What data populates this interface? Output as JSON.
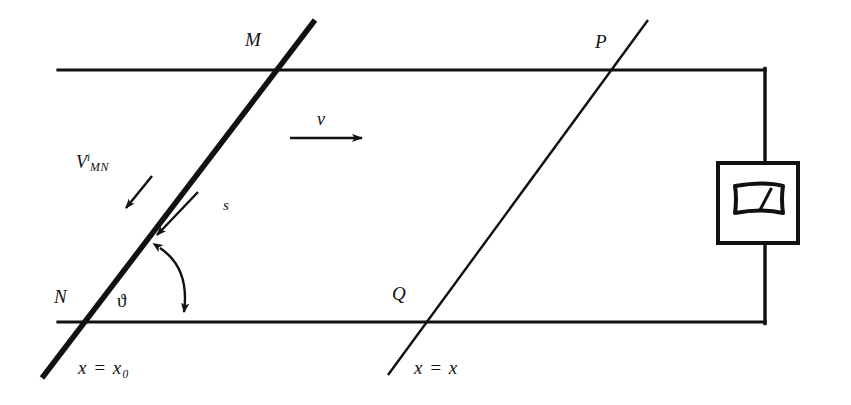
{
  "figure": {
    "background_color": "#ffffff",
    "ink_color": "#111111",
    "width": 851,
    "height": 405
  },
  "labels": {
    "point_m": "M",
    "point_n": "N",
    "point_p": "P",
    "point_q": "Q",
    "velocity": "v",
    "displacement": "s",
    "angle": "ϑ",
    "emf_v": "V",
    "emf_sup": "i",
    "emf_sub": "MN",
    "x_left_full": "x = x₀",
    "x_left_lhs": "x",
    "x_left_eq": "=",
    "x_left_rhs": "x₀",
    "x_right_full": "x = x",
    "x_right_lhs": "x",
    "x_right_eq": "=",
    "x_right_rhs": "x"
  },
  "geometry": {
    "rail_top": {
      "x1": 58,
      "y1": 70,
      "x2": 765,
      "y2": 70
    },
    "rail_bottom": {
      "x1": 58,
      "y1": 322,
      "x2": 765,
      "y2": 322
    },
    "wire_right": {
      "x1": 765,
      "y1": 70,
      "x2": 765,
      "y2": 322
    },
    "rod_mn": {
      "x1": 42,
      "y1": 378,
      "x2": 315,
      "y2": 20,
      "stroke_width": 5.5
    },
    "line_pq": {
      "x1": 388,
      "y1": 375,
      "x2": 648,
      "y2": 20,
      "stroke_width": 2.4
    },
    "intersection_m": {
      "x": 277,
      "y": 70
    },
    "intersection_n": {
      "x": 78,
      "y": 322
    },
    "intersection_p": {
      "x": 622,
      "y": 70
    },
    "intersection_q": {
      "x": 420,
      "y": 322
    },
    "velocity_arrow": {
      "x1": 290,
      "y1": 138,
      "x2": 370,
      "y2": 138
    },
    "emf_arrow": {
      "x1": 150,
      "y1": 178,
      "x2": 123,
      "y2": 212
    },
    "displacement_arrow": {
      "x1": 196,
      "y1": 194,
      "x2": 152,
      "y2": 240
    },
    "angle_arc": {
      "from_x": 183,
      "from_y": 318,
      "to_x": 157,
      "to_y": 244,
      "double_headed": true
    },
    "meter_box": {
      "x": 718,
      "y": 163,
      "width": 80,
      "height": 80
    }
  },
  "meter": {
    "name": "galvanometer",
    "box_stroke_width": 4,
    "scale_stroke_width": 4,
    "needle_stroke_width": 3
  },
  "label_positions": {
    "point_m": {
      "left": 245,
      "top": 30
    },
    "point_n": {
      "left": 54,
      "top": 287
    },
    "point_p": {
      "left": 595,
      "top": 32
    },
    "point_q": {
      "left": 392,
      "top": 284
    },
    "velocity": {
      "left": 315,
      "top": 110
    },
    "displacement": {
      "left": 223,
      "top": 200
    },
    "angle": {
      "left": 117,
      "top": 292
    },
    "emf": {
      "left": 76,
      "top": 152
    },
    "x_left": {
      "left": 78,
      "top": 359
    },
    "x_right": {
      "left": 414,
      "top": 359
    }
  }
}
